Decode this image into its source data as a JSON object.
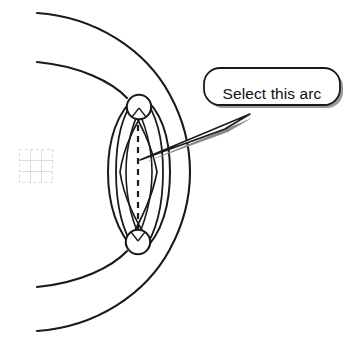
{
  "figure": {
    "title": "Select this arc",
    "background_color": "#ffffff",
    "line_color": "#1a1a1a",
    "grid_icon_color": "#d8d8d8",
    "shadow_color": "#808080"
  },
  "callout": {
    "label": "Select this arc",
    "text_color": "#101010",
    "fill_color": "#ffffff",
    "border_color": "#1a1a1a",
    "shape": "rounded-rectangle-speech-bubble",
    "tail_target_x": 140,
    "tail_target_y": 160
  },
  "geometry": {
    "outer_circle": {
      "name": "outer-sphere-silhouette",
      "cx": 10,
      "cy": 172,
      "r": 178
    },
    "inner_circle": {
      "name": "inner-sphere-silhouette",
      "cx": 10,
      "cy": 172,
      "r": 140
    },
    "top_circle": {
      "name": "top-cap-circle",
      "cx": 139,
      "cy": 107,
      "r": 12
    },
    "bottom_circle": {
      "name": "bottom-cap-circle",
      "cx": 138,
      "cy": 242,
      "r": 12
    },
    "center_axis": {
      "name": "dashed-center-axis",
      "x": 138,
      "y1": 114,
      "y2": 236
    },
    "lens_arc_count": 8
  },
  "grid_icon": {
    "name": "dashed-grid-icon",
    "x": 19,
    "y": 149,
    "cell": 11,
    "rows": 3,
    "cols": 3,
    "color": "#dcdcdc"
  },
  "icons": {
    "callout_icon": "speech-bubble-icon",
    "grid_icon": "dashed-grid-icon",
    "pointer_icon": "leader-line-icon"
  }
}
